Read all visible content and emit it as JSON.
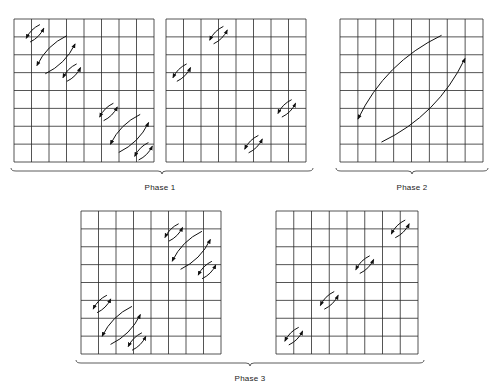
{
  "figure": {
    "grid_cells": 8,
    "line_color": "#2a2a2a",
    "arrow_color": "#111111"
  },
  "panels": [
    {
      "id": "phase1-a",
      "x": 14,
      "y": 19,
      "w": 140,
      "h": 143,
      "pairs": [
        {
          "c": 1.2,
          "r": 0.8,
          "s": 0.55
        },
        {
          "c": 2.4,
          "r": 2.0,
          "s": 1.2
        },
        {
          "c": 3.3,
          "r": 3.0,
          "s": 0.55
        },
        {
          "c": 5.4,
          "r": 5.2,
          "s": 0.55
        },
        {
          "c": 6.6,
          "r": 6.4,
          "s": 1.2
        },
        {
          "c": 7.4,
          "r": 7.4,
          "s": 0.55
        }
      ]
    },
    {
      "id": "phase1-b",
      "x": 166,
      "y": 19,
      "w": 140,
      "h": 143,
      "pairs": [
        {
          "c": 3.0,
          "r": 0.9,
          "s": 0.55
        },
        {
          "c": 0.9,
          "r": 3.0,
          "s": 0.55
        },
        {
          "c": 6.9,
          "r": 5.0,
          "s": 0.55
        },
        {
          "c": 5.0,
          "r": 7.0,
          "s": 0.55
        }
      ]
    },
    {
      "id": "phase2",
      "x": 340,
      "y": 19,
      "w": 143,
      "h": 143,
      "pairs": [
        {
          "c": 4.0,
          "r": 3.9,
          "s": 3.3
        }
      ]
    },
    {
      "id": "phase3-a",
      "x": 81,
      "y": 211,
      "w": 140,
      "h": 143,
      "pairs": [
        {
          "c": 5.3,
          "r": 1.2,
          "s": 0.55
        },
        {
          "c": 6.3,
          "r": 2.2,
          "s": 1.2
        },
        {
          "c": 7.2,
          "r": 3.3,
          "s": 0.55
        },
        {
          "c": 1.2,
          "r": 5.2,
          "s": 0.55
        },
        {
          "c": 2.3,
          "r": 6.4,
          "s": 1.2
        },
        {
          "c": 3.2,
          "r": 7.3,
          "s": 0.55
        }
      ]
    },
    {
      "id": "phase3-b",
      "x": 276,
      "y": 211,
      "w": 142,
      "h": 143,
      "pairs": [
        {
          "c": 7.0,
          "r": 1.0,
          "s": 0.55
        },
        {
          "c": 5.0,
          "r": 3.0,
          "s": 0.55
        },
        {
          "c": 3.0,
          "r": 5.0,
          "s": 0.55
        },
        {
          "c": 1.0,
          "r": 7.0,
          "s": 0.55
        }
      ]
    }
  ],
  "braces": [
    {
      "id": "brace-phase1",
      "x1": 11,
      "x2": 313,
      "y": 168,
      "label": "Phase 1",
      "label_x": 160,
      "label_y": 183
    },
    {
      "id": "brace-phase2",
      "x1": 336,
      "x2": 488,
      "y": 168,
      "label": "Phase 2",
      "label_x": 412,
      "label_y": 183
    },
    {
      "id": "brace-phase3",
      "x1": 76,
      "x2": 424,
      "y": 360,
      "label": "Phase 3",
      "label_x": 250,
      "label_y": 374
    }
  ],
  "labels": {
    "phase1": "Phase 1",
    "phase2": "Phase 2",
    "phase3": "Phase 3"
  }
}
